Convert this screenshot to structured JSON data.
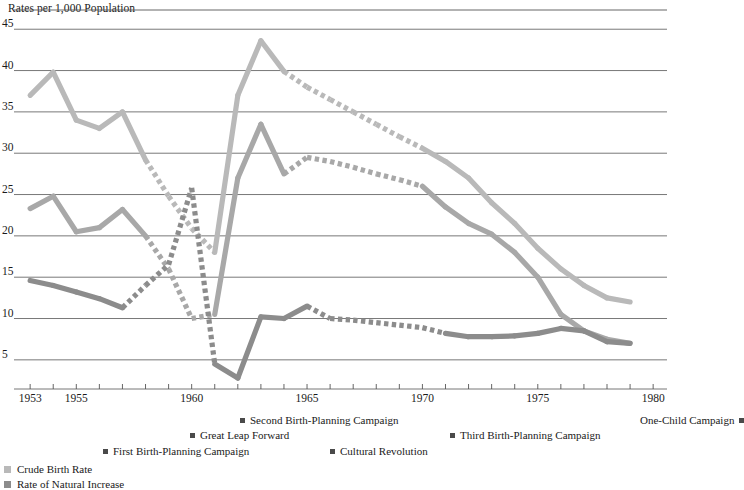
{
  "chart_data": {
    "type": "line",
    "title": "Rates per 1,000 Population",
    "ylabel": "Rates per 1,000 Population",
    "xlabel": "",
    "xlim": [
      1952.3,
      1980.6
    ],
    "ylim": [
      2.2,
      46.6
    ],
    "yticks": [
      5,
      10,
      15,
      20,
      25,
      30,
      35,
      40,
      45
    ],
    "xticks": [
      1953,
      1954,
      1955,
      1956,
      1957,
      1958,
      1959,
      1960,
      1961,
      1962,
      1963,
      1964,
      1965,
      1966,
      1967,
      1968,
      1969,
      1970,
      1971,
      1972,
      1973,
      1974,
      1975,
      1976,
      1977,
      1978,
      1979,
      1980
    ],
    "xtick_labels": [
      {
        "year": 1953,
        "label": "1953"
      },
      {
        "year": 1955,
        "label": "1955"
      },
      {
        "year": 1960,
        "label": "1960"
      },
      {
        "year": 1965,
        "label": "1965"
      },
      {
        "year": 1970,
        "label": "1970"
      },
      {
        "year": 1975,
        "label": "1975"
      },
      {
        "year": 1980,
        "label": "1980"
      }
    ],
    "grid": "horizontal",
    "legend_position": "bottom-left",
    "series": [
      {
        "name": "Crude Birth Rate",
        "color": "#b9b9b9",
        "x": [
          1953,
          1954,
          1955,
          1956,
          1957,
          1958,
          1959,
          1960,
          1961,
          1962,
          1963,
          1964,
          1965,
          1966,
          1967,
          1968,
          1969,
          1970,
          1971,
          1972,
          1973,
          1974,
          1975,
          1976,
          1977,
          1978,
          1979
        ],
        "values": [
          37.0,
          39.8,
          34.0,
          33.0,
          35.0,
          29.2,
          24.8,
          20.9,
          18.0,
          37.0,
          43.6,
          39.9,
          38.0,
          36.5,
          35.0,
          33.5,
          32.0,
          30.6,
          29.0,
          27.0,
          24.0,
          21.5,
          18.5,
          16.0,
          14.0,
          12.5,
          12.0
        ],
        "dashed_from": 1958,
        "dashed_to": 1961,
        "dashed_from_2": 1964,
        "dashed_to_2": 1970
      },
      {
        "name": "Crude Death Rate",
        "color": "#a8a8a8",
        "x": [
          1953,
          1954,
          1955,
          1956,
          1957,
          1958,
          1959,
          1960,
          1961,
          1962,
          1963,
          1964,
          1965,
          1966,
          1967,
          1968,
          1969,
          1970,
          1971,
          1972,
          1973,
          1974,
          1975,
          1976,
          1977,
          1978,
          1979
        ],
        "values": [
          23.3,
          24.8,
          20.5,
          21.0,
          23.2,
          20.0,
          16.0,
          10.0,
          10.5,
          27.0,
          33.5,
          27.5,
          29.5,
          29.0,
          28.3,
          27.5,
          26.8,
          26.0,
          23.5,
          21.5,
          20.2,
          18.0,
          15.0,
          10.5,
          8.5,
          7.5,
          7.0
        ],
        "dashed_from": 1958,
        "dashed_to": 1961,
        "dashed_from_2": 1964,
        "dashed_to_2": 1970
      },
      {
        "name": "Rate of Natural Increase",
        "color": "#8c8c8c",
        "x": [
          1953,
          1954,
          1955,
          1956,
          1957,
          1958,
          1959,
          1960,
          1961,
          1962,
          1963,
          1964,
          1965,
          1966,
          1967,
          1968,
          1969,
          1970,
          1971,
          1972,
          1973,
          1974,
          1975,
          1976,
          1977,
          1978,
          1979
        ],
        "values": [
          14.6,
          14.0,
          13.2,
          12.4,
          11.3,
          14.0,
          16.5,
          25.8,
          4.5,
          2.8,
          10.2,
          10.0,
          11.5,
          10.0,
          9.8,
          9.5,
          9.2,
          8.9,
          8.2,
          7.8,
          7.8,
          7.9,
          8.2,
          8.8,
          8.5,
          7.2,
          7.0
        ],
        "dashed_from": 1957,
        "dashed_to": 1961,
        "dashed_from_2": 1965,
        "dashed_to_2": 1971
      }
    ],
    "annotations": [
      {
        "label": "Second Birth-Planning Campaign",
        "marker_side": "left",
        "x": 240,
        "y": 414
      },
      {
        "label": "One-Child Campaign",
        "marker_side": "right",
        "x": 640,
        "y": 414
      },
      {
        "label": "Great Leap Forward",
        "marker_side": "left",
        "x": 190,
        "y": 429
      },
      {
        "label": "Third Birth-Planning Campaign",
        "marker_side": "left",
        "x": 450,
        "y": 429
      },
      {
        "label": "First Birth-Planning Campaign",
        "marker_side": "left",
        "x": 103,
        "y": 445
      },
      {
        "label": "Cultural Revolution",
        "marker_side": "left",
        "x": 330,
        "y": 445
      }
    ],
    "legend": [
      {
        "label": "Crude Birth Rate",
        "color": "#b9b9b9"
      },
      {
        "label": "Rate of Natural Increase",
        "color": "#8c8c8c"
      }
    ]
  }
}
